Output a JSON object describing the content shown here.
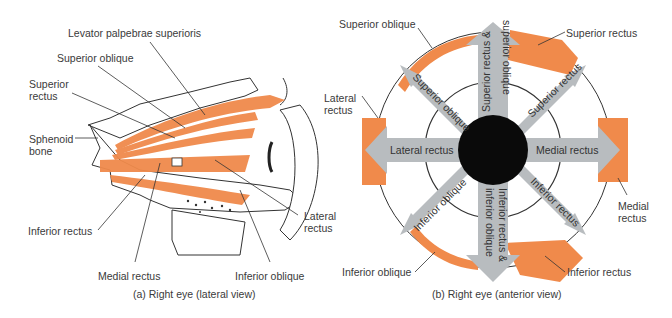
{
  "panel_a": {
    "caption": "(a) Right eye (lateral view)",
    "labels": {
      "levator": "Levator palpebrae superioris",
      "superior_oblique": "Superior oblique",
      "superior_rectus_1": "Superior",
      "superior_rectus_2": "rectus",
      "sphenoid_1": "Sphenoid",
      "sphenoid_2": "bone",
      "inferior_rectus": "Inferior rectus",
      "medial_rectus": "Medial rectus",
      "inferior_oblique": "Inferior oblique",
      "lateral_rectus_1": "Lateral",
      "lateral_rectus_2": "rectus"
    }
  },
  "panel_b": {
    "caption": "(b) Right eye (anterior view)",
    "labels": {
      "superior_oblique": "Superior oblique",
      "superior_rectus": "Superior rectus",
      "lateral_rectus_1": "Lateral",
      "lateral_rectus_2": "rectus",
      "medial_rectus_1": "Medial",
      "medial_rectus_2": "rectus",
      "inferior_oblique": "Inferior oblique",
      "inferior_rectus": "Inferior rectus"
    },
    "arrows": {
      "up_1": "Superior rectus &",
      "up_2": "superior oblique",
      "up_left": "Superior oblique",
      "up_right": "Superior rectus",
      "left": "Lateral rectus",
      "right": "Medial rectus",
      "down_left": "Inferior oblique",
      "down_right": "Inferior rectus",
      "down_1": "Inferior rectus &",
      "down_2": "inferior oblique"
    }
  },
  "colors": {
    "muscle": "#f08a4b",
    "arrow": "#b8bcbf",
    "pupil": "#0a0a0a"
  }
}
